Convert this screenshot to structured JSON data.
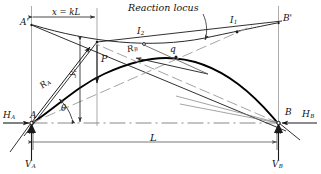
{
  "figure": {
    "background": "#ffffff",
    "line_color": "#1a1a1a",
    "curve_color": "#000000",
    "thin_color": "#555555"
  },
  "annotations": {
    "reaction_locus": "Reaction locus",
    "span_dimension": "L",
    "load_position_dimension": "x = kL",
    "load": "P"
  },
  "points": {
    "A": "A",
    "B": "B",
    "A_prime": "A'",
    "B_prime": "B'",
    "q": "q",
    "I1_base": "I",
    "I1_sub": "1",
    "I2_base": "I",
    "I2_sub": "2"
  },
  "forces": {
    "HA_base": "H",
    "HA_sub": "A",
    "HB_base": "H",
    "HB_sub": "B",
    "VA_base": "V",
    "VA_sub": "A",
    "VB_base": "V",
    "VB_sub": "B",
    "RA_base": "R",
    "RA_sub": "A",
    "RB_base": "R",
    "RB_sub": "B"
  },
  "dimensions": {
    "yr_base": "y",
    "yr_sub": "r",
    "theta": "θ"
  }
}
